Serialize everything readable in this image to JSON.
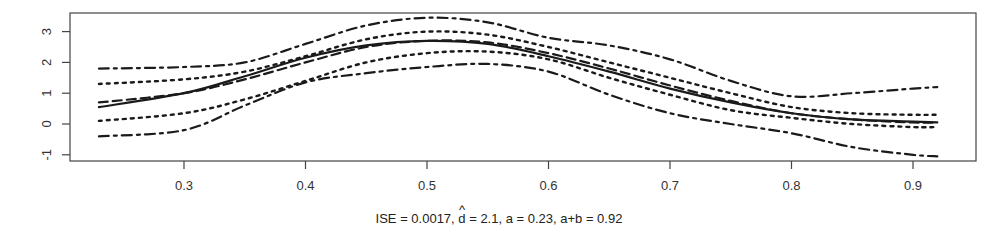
{
  "chart_data": {
    "type": "line",
    "title": "",
    "xlabel": "ISE =  0.0017, d̂ = 2.1,  a = 0.23,  a+b = 0.92",
    "xlabel_parts": {
      "prefix": "ISE =  0.0017, ",
      "hat_symbol": "^",
      "d_symbol": "d",
      "suffix": " = 2.1,  a = 0.23,  a+b = 0.92"
    },
    "ylabel": "",
    "xlim": [
      0.205,
      0.95
    ],
    "ylim": [
      -1.2,
      3.6
    ],
    "grid": false,
    "legend": null,
    "x_ticks": [
      0.3,
      0.4,
      0.5,
      0.6,
      0.7,
      0.8,
      0.9
    ],
    "x_tick_labels": [
      "0.3",
      "0.4",
      "0.5",
      "0.6",
      "0.7",
      "0.8",
      "0.9"
    ],
    "y_ticks": [
      -1,
      0,
      1,
      2,
      3
    ],
    "y_tick_labels": [
      "-1",
      "0",
      "1",
      "2",
      "3"
    ],
    "x": [
      0.23,
      0.3,
      0.35,
      0.4,
      0.45,
      0.5,
      0.55,
      0.6,
      0.65,
      0.7,
      0.75,
      0.8,
      0.85,
      0.9,
      0.92
    ],
    "series": [
      {
        "name": "upper outer band",
        "style": "dashdot",
        "values": [
          1.8,
          1.85,
          2.0,
          2.6,
          3.2,
          3.45,
          3.3,
          2.8,
          2.55,
          2.1,
          1.4,
          0.9,
          1.0,
          1.15,
          1.2
        ]
      },
      {
        "name": "upper inner band",
        "style": "dotted",
        "values": [
          1.3,
          1.45,
          1.7,
          2.2,
          2.75,
          3.0,
          2.9,
          2.5,
          2.0,
          1.5,
          1.0,
          0.55,
          0.35,
          0.3,
          0.3
        ]
      },
      {
        "name": "true curve",
        "style": "dashed",
        "values": [
          0.7,
          1.0,
          1.45,
          2.0,
          2.5,
          2.7,
          2.65,
          2.3,
          1.8,
          1.25,
          0.75,
          0.35,
          0.15,
          0.05,
          0.05
        ]
      },
      {
        "name": "estimate",
        "style": "solid",
        "values": [
          0.55,
          1.0,
          1.55,
          2.15,
          2.55,
          2.7,
          2.6,
          2.2,
          1.7,
          1.15,
          0.7,
          0.35,
          0.15,
          0.08,
          0.05
        ]
      },
      {
        "name": "lower inner band",
        "style": "dotted",
        "values": [
          0.1,
          0.35,
          0.8,
          1.4,
          2.0,
          2.3,
          2.35,
          2.1,
          1.5,
          0.95,
          0.45,
          0.2,
          0.0,
          -0.1,
          -0.1
        ]
      },
      {
        "name": "lower outer band",
        "style": "dashdot",
        "values": [
          -0.4,
          -0.2,
          0.6,
          1.35,
          1.65,
          1.85,
          1.95,
          1.7,
          0.95,
          0.35,
          0.0,
          -0.3,
          -0.75,
          -1.0,
          -1.05
        ]
      }
    ]
  },
  "colors": {
    "line": "#1a1a1a",
    "axis": "#444444",
    "background": "#ffffff"
  }
}
